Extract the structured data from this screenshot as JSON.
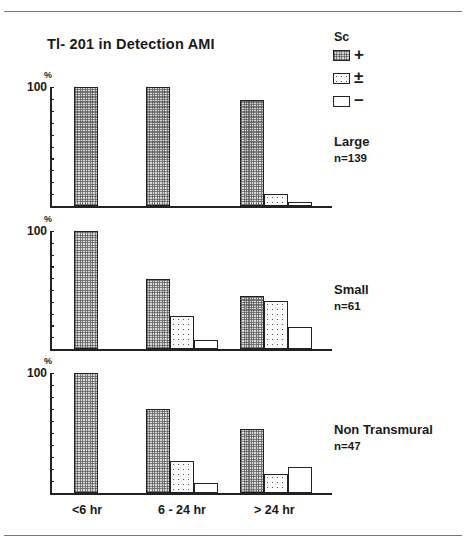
{
  "title": "Tl- 201  in Detection  AMI",
  "legend": {
    "title": "Sc",
    "items": [
      {
        "key": "pos",
        "symbol": "+",
        "pattern": "dense-grid"
      },
      {
        "key": "pm",
        "symbol": "±",
        "pattern": "dotted"
      },
      {
        "key": "neg",
        "symbol": "−",
        "pattern": "white"
      }
    ]
  },
  "axis": {
    "unit": "%",
    "top_label": "100"
  },
  "x_labels": [
    "<6 hr",
    "6 - 24 hr",
    "> 24 hr"
  ],
  "panels": [
    {
      "label": "Large",
      "n": "n=139"
    },
    {
      "label": "Small",
      "n": "n=61"
    },
    {
      "label": "Non Transmural",
      "n": "n=47"
    }
  ],
  "chart_data": [
    {
      "type": "bar",
      "title": "Tl- 201 in Detection AMI — Large (n=139)",
      "categories": [
        "<6 hr",
        "6 - 24 hr",
        "> 24 hr"
      ],
      "series": [
        {
          "name": "+",
          "values": [
            100,
            100,
            89
          ]
        },
        {
          "name": "±",
          "values": [
            0,
            0,
            10
          ]
        },
        {
          "name": "−",
          "values": [
            0,
            0,
            3
          ]
        }
      ],
      "xlabel": "",
      "ylabel": "%",
      "ylim": [
        0,
        100
      ],
      "ticks_every": 10,
      "grid": false,
      "legend_position": "right"
    },
    {
      "type": "bar",
      "title": "Tl- 201 in Detection AMI — Small (n=61)",
      "categories": [
        "<6 hr",
        "6 - 24 hr",
        "> 24 hr"
      ],
      "series": [
        {
          "name": "+",
          "values": [
            100,
            59,
            45
          ]
        },
        {
          "name": "±",
          "values": [
            0,
            28,
            41
          ]
        },
        {
          "name": "−",
          "values": [
            0,
            8,
            19
          ]
        }
      ],
      "xlabel": "",
      "ylabel": "%",
      "ylim": [
        0,
        100
      ],
      "ticks_every": 10,
      "grid": false,
      "legend_position": "right"
    },
    {
      "type": "bar",
      "title": "Tl- 201 in Detection AMI — Non Transmural (n=47)",
      "categories": [
        "<6 hr",
        "6 - 24 hr",
        "> 24 hr"
      ],
      "series": [
        {
          "name": "+",
          "values": [
            100,
            70,
            53
          ]
        },
        {
          "name": "±",
          "values": [
            0,
            27,
            16
          ]
        },
        {
          "name": "−",
          "values": [
            0,
            8,
            22
          ]
        }
      ],
      "xlabel": "",
      "ylabel": "%",
      "ylim": [
        0,
        100
      ],
      "ticks_every": 10,
      "grid": false,
      "legend_position": "right"
    }
  ]
}
